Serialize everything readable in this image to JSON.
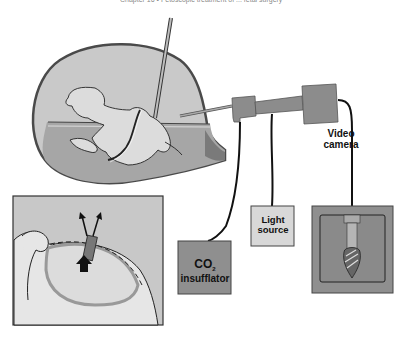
{
  "header": {
    "running_head": "Chapter 16 • Fetoscopic treatment of ... fetal surgery"
  },
  "figure": {
    "type": "medical-illustration",
    "components": {
      "uterus": {
        "name": "uterus with fetus",
        "fill": "#c9c9c9",
        "outline": "#555555"
      },
      "needle": {
        "name": "fetoscopic needle"
      },
      "fetoscope": {
        "name": "fetoscope",
        "fill": "#8c8c8c"
      },
      "inset": {
        "name": "magnified inset view",
        "fill": "#c8c8c8"
      },
      "co2_box": {
        "line1": "CO",
        "subscript": "2",
        "line2": "insufflator",
        "fill": "#8f8f8f"
      },
      "light_box": {
        "line1": "Light",
        "line2": "source",
        "fill": "#d8d8d8"
      },
      "camera_label": {
        "line1": "Video",
        "line2": "camera"
      },
      "monitor": {
        "name": "video monitor showing burr tool",
        "fill": "#8f8f8f"
      }
    }
  }
}
